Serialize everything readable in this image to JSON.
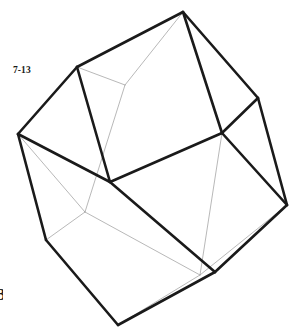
{
  "figure": {
    "label": "7-13",
    "corner_mark": "3",
    "type": "wireframe-cube-perspective",
    "background_color": "#ffffff",
    "visible_edge_color": "#1a1a1a",
    "hidden_edge_color": "#9a9a9a",
    "visible_edge_width": 2.6,
    "hidden_edge_width": 0.7,
    "vertices": {
      "top": [
        183,
        12
      ],
      "upper_left": [
        77,
        67
      ],
      "upper_right": [
        258,
        98
      ],
      "left": [
        18,
        134
      ],
      "right": [
        287,
        205
      ],
      "center": [
        110,
        182
      ],
      "center_right": [
        222,
        133
      ],
      "lower_left": [
        46,
        240
      ],
      "lower_right": [
        215,
        272
      ],
      "bottom": [
        118,
        325
      ],
      "hidden_back_top": [
        125,
        85
      ],
      "hidden_back_left": [
        85,
        212
      ],
      "hidden_back_bottom": [
        200,
        275
      ]
    },
    "visible_edges": [
      [
        "top",
        "upper_left"
      ],
      [
        "top",
        "upper_right"
      ],
      [
        "top",
        "center_right"
      ],
      [
        "upper_left",
        "left"
      ],
      [
        "upper_left",
        "center"
      ],
      [
        "upper_right",
        "right"
      ],
      [
        "upper_right",
        "center_right"
      ],
      [
        "center_right",
        "center"
      ],
      [
        "center_right",
        "right"
      ],
      [
        "left",
        "center"
      ],
      [
        "left",
        "lower_left"
      ],
      [
        "center",
        "lower_right"
      ],
      [
        "right",
        "lower_right"
      ],
      [
        "lower_left",
        "bottom"
      ],
      [
        "lower_right",
        "bottom"
      ]
    ],
    "hidden_edges": [
      [
        "upper_left",
        "hidden_back_top"
      ],
      [
        "top",
        "hidden_back_top"
      ],
      [
        "hidden_back_top",
        "hidden_back_left"
      ],
      [
        "left",
        "hidden_back_left"
      ],
      [
        "hidden_back_left",
        "hidden_back_bottom"
      ],
      [
        "lower_left",
        "hidden_back_left"
      ],
      [
        "hidden_back_bottom",
        "bottom"
      ],
      [
        "center_right",
        "hidden_back_bottom"
      ],
      [
        "right",
        "hidden_back_bottom"
      ]
    ]
  }
}
